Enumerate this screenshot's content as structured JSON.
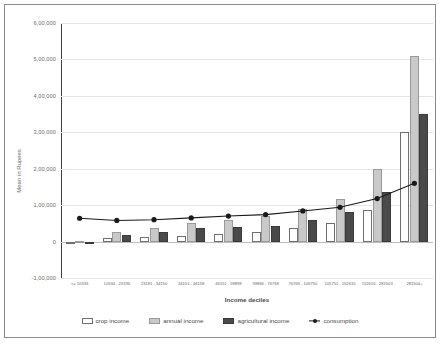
{
  "chart_data": {
    "type": "bar",
    "title": "",
    "xlabel": "Income deciles",
    "ylabel": "Mean in Rupees",
    "ylim": [
      -100000,
      600000
    ],
    "ytick_labels": [
      "6,00,000",
      "5,00,000",
      "4,00,000",
      "3,00,000",
      "2,00,000",
      "1,00,000",
      "0",
      "-1,00,000"
    ],
    "ytick_values": [
      600000,
      500000,
      400000,
      300000,
      200000,
      100000,
      0,
      -100000
    ],
    "grid": true,
    "legend_position": "bottom",
    "categories": [
      "<= 10533",
      "10534 - 23196",
      "23181 - 34150",
      "34151 - 46158",
      "46151 - 59899",
      "59896 - 76768",
      "76769 - 105750",
      "105751 - 152615",
      "152616 - 281503",
      "281504+"
    ],
    "series": [
      {
        "name": "crop income",
        "style": "bar-dotted-white",
        "values": [
          -2000,
          9000,
          13000,
          16000,
          20000,
          26000,
          36000,
          50000,
          86000,
          300000
        ]
      },
      {
        "name": "annual income",
        "style": "bar-light-gray",
        "values": [
          1000,
          27000,
          38000,
          52000,
          60000,
          70000,
          90000,
          118000,
          200000,
          510000
        ]
      },
      {
        "name": "agricultural income",
        "style": "bar-dark-gray",
        "values": [
          0,
          18000,
          26000,
          36000,
          40000,
          44000,
          60000,
          82000,
          135000,
          350000
        ]
      },
      {
        "name": "consumption",
        "style": "line-marker-black",
        "values": [
          64000,
          58000,
          60000,
          65000,
          70000,
          74000,
          84000,
          94000,
          118000,
          160000
        ]
      }
    ]
  },
  "legend": {
    "items": [
      {
        "label": "crop income",
        "swatch": "crop"
      },
      {
        "label": "annual income",
        "swatch": "annual"
      },
      {
        "label": "agricultural income",
        "swatch": "agri"
      },
      {
        "label": "consumption",
        "swatch": "line"
      }
    ]
  },
  "colors": {
    "crop": "#ffffff",
    "annual": "#c9c9c9",
    "agricultural": "#4a4a4a",
    "consumption": "#1a1a1a",
    "grid": "#e4e4e4",
    "axis_text": "#6b6b6b",
    "border": "#8a8a8a"
  }
}
